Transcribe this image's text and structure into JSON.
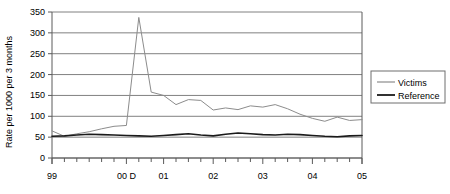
{
  "chart_data": {
    "type": "line",
    "title": "",
    "xlabel": "",
    "ylabel": "Rate per 1000 per 3 months",
    "ylim": [
      0,
      350
    ],
    "ytick_values": [
      0,
      50,
      100,
      150,
      200,
      250,
      300,
      350
    ],
    "ytick_labels": [
      "0",
      "50",
      "100",
      "150",
      "200",
      "250",
      "300",
      "350"
    ],
    "grid": true,
    "grid_axis": "y",
    "legend_position": "right",
    "x_axis_note": "quarterly ticks; year labels shown at year starts",
    "xtick_labels": [
      "99",
      "00 D",
      "01",
      "02",
      "03",
      "04",
      "05"
    ],
    "xtick_positions": [
      0,
      6,
      9,
      13,
      17,
      21,
      25
    ],
    "x": [
      0,
      1,
      2,
      3,
      4,
      5,
      6,
      7,
      8,
      9,
      10,
      11,
      12,
      13,
      14,
      15,
      16,
      17,
      18,
      19,
      20,
      21,
      22,
      23,
      24,
      25
    ],
    "series": [
      {
        "name": "Victims",
        "color": "#8c8c8c",
        "values": [
          65,
          52,
          58,
          63,
          70,
          76,
          78,
          337,
          158,
          150,
          128,
          140,
          138,
          115,
          120,
          116,
          125,
          122,
          128,
          118,
          105,
          95,
          88,
          98,
          90,
          92
        ]
      },
      {
        "name": "Reference",
        "color": "#1a1a1a",
        "values": [
          52,
          53,
          55,
          57,
          56,
          55,
          54,
          53,
          52,
          54,
          56,
          58,
          55,
          53,
          57,
          60,
          58,
          56,
          55,
          57,
          56,
          54,
          52,
          51,
          53,
          54
        ]
      }
    ]
  },
  "legend": {
    "items": [
      {
        "label": "Victims"
      },
      {
        "label": "Reference"
      }
    ]
  }
}
